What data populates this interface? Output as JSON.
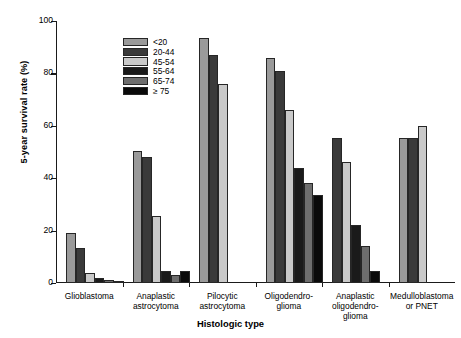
{
  "chart_data": {
    "type": "bar",
    "title": "",
    "xlabel": "Histologic type",
    "ylabel": "5-year survival rate (%)",
    "ylim": [
      0,
      100
    ],
    "yticks": [
      0,
      20,
      40,
      60,
      80,
      100
    ],
    "grid": false,
    "legend_position": "top-left inside plot",
    "categories": [
      "Glioblastoma",
      "Anaplastic astrocytoma",
      "Pilocytic astrocytoma",
      "Oligodendroglioma",
      "Anaplastic oligodendroglioma",
      "Medulloblastoma or PNET"
    ],
    "category_label_lines": [
      [
        "Glioblastoma"
      ],
      [
        "Anaplastic",
        "astrocytoma"
      ],
      [
        "Pilocytic",
        "astrocytoma"
      ],
      [
        "Oligodendro-",
        "glioma"
      ],
      [
        "Anaplastic",
        "oligodendro-",
        "glioma"
      ],
      [
        "Medulloblastoma",
        "or PNET"
      ]
    ],
    "series": [
      {
        "name": "<20",
        "color": "#9a9a9a",
        "values": [
          19.0,
          50.5,
          93.5,
          86.0,
          null,
          55.5
        ]
      },
      {
        "name": "20-44",
        "color": "#3a3a3a",
        "values": [
          13.4,
          48.0,
          87.0,
          81.0,
          55.5,
          55.5
        ]
      },
      {
        "name": "45-54",
        "color": "#c9c9c9",
        "values": [
          4.0,
          25.5,
          76.0,
          66.0,
          46.0,
          60.0
        ]
      },
      {
        "name": "55-64",
        "color": "#1a1a1a",
        "values": [
          2.0,
          4.5,
          null,
          44.0,
          22.0,
          null
        ]
      },
      {
        "name": "65-74",
        "color": "#6e6e6e",
        "values": [
          1.0,
          3.0,
          null,
          38.0,
          14.0,
          null
        ]
      },
      {
        "name": "≥ 75",
        "color": "#0a0a0a",
        "values": [
          0.5,
          4.5,
          null,
          33.5,
          4.5,
          null
        ]
      }
    ]
  },
  "legend": {
    "items": [
      {
        "label": "<20"
      },
      {
        "label": "20-44"
      },
      {
        "label": "45-54"
      },
      {
        "label": "55-64"
      },
      {
        "label": "65-74"
      },
      {
        "label": "≥ 75"
      }
    ]
  }
}
